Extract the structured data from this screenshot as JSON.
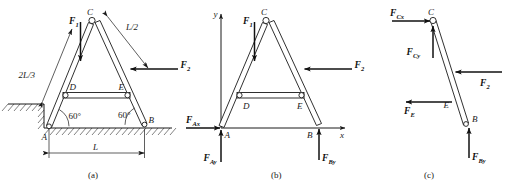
{
  "figure": {
    "ink_color": "#1a1a1a",
    "background_color": "#ffffff"
  },
  "panels": [
    {
      "id": "a",
      "caption": "(a)"
    },
    {
      "id": "b",
      "caption": "(b)"
    },
    {
      "id": "c",
      "caption": "(c)"
    }
  ],
  "panel_a": {
    "caption": "(a)",
    "joints": {
      "A": "A",
      "B": "B",
      "C": "C",
      "D": "D",
      "E": "E"
    },
    "forces": [
      {
        "name": "F1",
        "label": "F",
        "sub": "1",
        "direction": "down"
      },
      {
        "name": "F2",
        "label": "F",
        "sub": "2",
        "direction": "left"
      }
    ],
    "dimensions": [
      {
        "name": "two-thirds-L",
        "label": "2L/3"
      },
      {
        "name": "half-L",
        "label": "L/2"
      },
      {
        "name": "span-L",
        "label": "L"
      }
    ],
    "angles": [
      {
        "name": "angle-at-A",
        "label": "60°"
      },
      {
        "name": "angle-at-B",
        "label": "60°"
      }
    ]
  },
  "panel_b": {
    "caption": "(b)",
    "joints": {
      "A": "A",
      "B": "B",
      "C": "C",
      "D": "D",
      "E": "E"
    },
    "axes": {
      "x": "x",
      "y": "y"
    },
    "forces": [
      {
        "name": "F1",
        "label": "F",
        "sub": "1",
        "direction": "down"
      },
      {
        "name": "F2",
        "label": "F",
        "sub": "2",
        "direction": "left"
      },
      {
        "name": "FAx",
        "label": "F",
        "sub": "Ax",
        "direction": "right"
      },
      {
        "name": "FAy",
        "label": "F",
        "sub": "Ay",
        "direction": "up"
      },
      {
        "name": "FBy",
        "label": "F",
        "sub": "By",
        "direction": "up"
      }
    ]
  },
  "panel_c": {
    "caption": "(c)",
    "joints": {
      "B": "B",
      "C": "C",
      "E": "E"
    },
    "forces": [
      {
        "name": "FCx",
        "label": "F",
        "sub": "Cx",
        "direction": "right"
      },
      {
        "name": "FCy",
        "label": "F",
        "sub": "Cy",
        "direction": "up"
      },
      {
        "name": "F2",
        "label": "F",
        "sub": "2",
        "direction": "left"
      },
      {
        "name": "FE",
        "label": "F",
        "sub": "E",
        "direction": "left"
      },
      {
        "name": "FBy",
        "label": "F",
        "sub": "By",
        "direction": "up"
      }
    ]
  }
}
